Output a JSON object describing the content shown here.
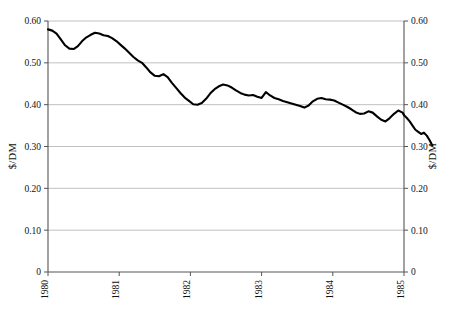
{
  "chart_data": {
    "type": "line",
    "title": "",
    "xlabel": "",
    "ylabel": "$/DM",
    "ylabel_right": "$/DM",
    "ylim": [
      0,
      0.6
    ],
    "xlim": [
      1980,
      1985
    ],
    "grid": true,
    "legend": "none",
    "y_ticks": [
      "0",
      "0.10",
      "0.20",
      "0.30",
      "0.40",
      "0.50",
      "0.60"
    ],
    "y_tick_values": [
      0,
      0.1,
      0.2,
      0.3,
      0.4,
      0.5,
      0.6
    ],
    "y_ticks_right": [
      "0",
      "0.10",
      "0.20",
      "0.30",
      "0.40",
      "0.50",
      "0.60"
    ],
    "x_ticks": [
      "1980",
      "1981",
      "1982",
      "1983",
      "1984",
      "1985"
    ],
    "x_tick_values": [
      1980,
      1981,
      1982,
      1983,
      1984,
      1985
    ],
    "series": [
      {
        "name": "$/DM",
        "x": [
          1980.0,
          1980.06,
          1980.12,
          1980.18,
          1980.24,
          1980.3,
          1980.36,
          1980.42,
          1980.48,
          1980.54,
          1980.6,
          1980.66,
          1980.72,
          1980.78,
          1980.84,
          1980.9,
          1980.96,
          1981.02,
          1981.08,
          1981.14,
          1981.2,
          1981.26,
          1981.32,
          1981.38,
          1981.44,
          1981.5,
          1981.56,
          1981.62,
          1981.68,
          1981.74,
          1981.8,
          1981.86,
          1981.92,
          1981.98,
          1982.04,
          1982.1,
          1982.16,
          1982.22,
          1982.28,
          1982.34,
          1982.4,
          1982.46,
          1982.52,
          1982.58,
          1982.64,
          1982.7,
          1982.76,
          1982.82,
          1982.88,
          1982.94,
          1983.0,
          1983.06,
          1983.12,
          1983.18,
          1983.24,
          1983.3,
          1983.36,
          1983.42,
          1983.48,
          1983.54,
          1983.6,
          1983.66,
          1983.72,
          1983.78,
          1983.84,
          1983.9,
          1983.96,
          1984.02,
          1984.08,
          1984.14,
          1984.2,
          1984.26,
          1984.32,
          1984.38,
          1984.44,
          1984.5,
          1984.56,
          1984.62,
          1984.68,
          1984.74,
          1984.8,
          1984.86,
          1984.92,
          1984.98,
          1985.0
        ],
        "values": [
          0.58,
          0.577,
          0.57,
          0.556,
          0.542,
          0.534,
          0.533,
          0.54,
          0.552,
          0.561,
          0.567,
          0.572,
          0.57,
          0.566,
          0.564,
          0.559,
          0.552,
          0.543,
          0.534,
          0.524,
          0.514,
          0.506,
          0.5,
          0.489,
          0.477,
          0.469,
          0.468,
          0.473,
          0.466,
          0.452,
          0.44,
          0.428,
          0.417,
          0.409,
          0.401,
          0.4,
          0.404,
          0.414,
          0.427,
          0.437,
          0.444,
          0.448,
          0.446,
          0.441,
          0.434,
          0.428,
          0.424,
          0.422,
          0.423,
          0.419,
          0.416,
          0.43,
          0.422,
          0.416,
          0.413,
          0.409,
          0.406,
          0.403,
          0.4,
          0.397,
          0.393,
          0.398,
          0.408,
          0.414,
          0.416,
          0.413,
          0.412,
          0.41,
          0.405,
          0.4,
          0.395,
          0.389,
          0.382,
          0.378,
          0.379,
          0.384,
          0.381,
          0.372,
          0.364,
          0.36,
          0.368,
          0.378,
          0.386,
          0.381,
          0.375
        ]
      },
      {
        "name": "$/DM-tail",
        "x": [
          1985.0,
          1985.04,
          1985.08,
          1985.12,
          1985.16,
          1985.2,
          1985.24,
          1985.28,
          1985.32,
          1985.36,
          1985.4
        ],
        "values": [
          0.375,
          0.368,
          0.36,
          0.35,
          0.34,
          0.335,
          0.33,
          0.333,
          0.326,
          0.315,
          0.302
        ]
      }
    ]
  }
}
